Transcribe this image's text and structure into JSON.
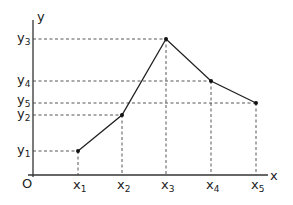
{
  "diagram": {
    "type": "piecewise-linear-graph",
    "axes": {
      "x_label": "x",
      "y_label": "y",
      "origin_label": "O"
    },
    "points": [
      {
        "x_label": "x",
        "x_sub": "1",
        "y_label": "y",
        "y_sub": "1",
        "px": 78,
        "py": 151
      },
      {
        "x_label": "x",
        "x_sub": "2",
        "y_label": "y",
        "y_sub": "2",
        "px": 122,
        "py": 115
      },
      {
        "x_label": "x",
        "x_sub": "3",
        "y_label": "y",
        "y_sub": "3",
        "px": 166,
        "py": 39
      },
      {
        "x_label": "x",
        "x_sub": "4",
        "y_label": "y",
        "y_sub": "4",
        "px": 211,
        "py": 81
      },
      {
        "x_label": "x",
        "x_sub": "5",
        "y_label": "y",
        "y_sub": "5",
        "px": 256,
        "py": 103
      }
    ],
    "colors": {
      "line": "#222222",
      "background": "#ffffff"
    }
  }
}
